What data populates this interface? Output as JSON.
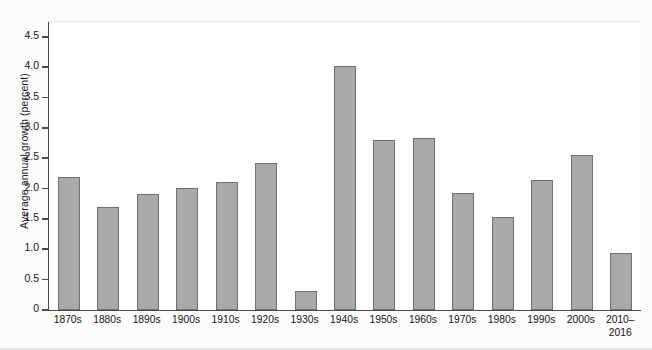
{
  "chart_data": {
    "type": "bar",
    "title": "",
    "xlabel": "",
    "ylabel": "Average annual growth (percent)",
    "categories": [
      "1870s",
      "1880s",
      "1890s",
      "1900s",
      "1910s",
      "1920s",
      "1930s",
      "1940s",
      "1950s",
      "1960s",
      "1970s",
      "1980s",
      "1990s",
      "2000s",
      "2010–\n2016"
    ],
    "values": [
      2.2,
      1.7,
      1.92,
      2.01,
      2.11,
      2.42,
      0.31,
      4.03,
      2.8,
      2.83,
      1.93,
      1.54,
      2.15,
      2.55,
      0.94
    ],
    "ylim": [
      0,
      4.75
    ],
    "yticks": [
      "0",
      "0.5",
      "1.0",
      "1.5",
      "2.0",
      "2.5",
      "3.0",
      "3.5",
      "4.0",
      "4.5"
    ],
    "ytick_values": [
      0,
      0.5,
      1.0,
      1.5,
      2.0,
      2.5,
      3.0,
      3.5,
      4.0,
      4.5
    ],
    "grid": false,
    "legend": null,
    "bar_color": "#a9a9a9",
    "bar_border_color": "#6f6f6f",
    "axis_color": "#4a4a4a",
    "background": "#ffffff"
  }
}
